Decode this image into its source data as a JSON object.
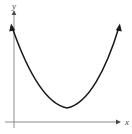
{
  "figure": {
    "kind": "parabola-graph",
    "background_color": "#ffffff",
    "axis_color": "#8c8c8c",
    "curve_color": "#1a1a1a",
    "label_color": "#4a4a4a",
    "width": 132,
    "height": 134
  },
  "axes": {
    "x_label": "x",
    "y_label": "y",
    "x_axis": {
      "x1": 5,
      "y1": 122,
      "x2": 118,
      "y2": 122,
      "arrow": "right"
    },
    "y_axis": {
      "x1": 14,
      "y1": 128,
      "x2": 14,
      "y2": 11,
      "arrow": "up"
    },
    "x_label_pos": {
      "x": 125,
      "y": 125
    },
    "y_label_pos": {
      "x": 12,
      "y": 9
    }
  },
  "chart_data": {
    "type": "line",
    "title": "",
    "xlabel": "x",
    "ylabel": "y",
    "grid": false,
    "legend": null,
    "curve_shape": "upward-opening parabola",
    "arrowheads": [
      "left-end",
      "right-end"
    ],
    "vertex_px": {
      "x": 67,
      "y": 108
    },
    "left_endpoint_px": {
      "x": 12,
      "y": 27
    },
    "right_endpoint_px": {
      "x": 119,
      "y": 27
    },
    "path": "M 12,27 C 27,70 46,104 67,108 C 88,104 106,70 119,27",
    "points_px": [
      {
        "x": 12,
        "y": 27
      },
      {
        "x": 20,
        "y": 49
      },
      {
        "x": 28,
        "y": 67
      },
      {
        "x": 36,
        "y": 81
      },
      {
        "x": 44,
        "y": 92
      },
      {
        "x": 52,
        "y": 100
      },
      {
        "x": 60,
        "y": 105
      },
      {
        "x": 67,
        "y": 108
      },
      {
        "x": 75,
        "y": 106
      },
      {
        "x": 83,
        "y": 100
      },
      {
        "x": 91,
        "y": 90
      },
      {
        "x": 99,
        "y": 76
      },
      {
        "x": 107,
        "y": 58
      },
      {
        "x": 113,
        "y": 44
      },
      {
        "x": 119,
        "y": 27
      }
    ]
  }
}
